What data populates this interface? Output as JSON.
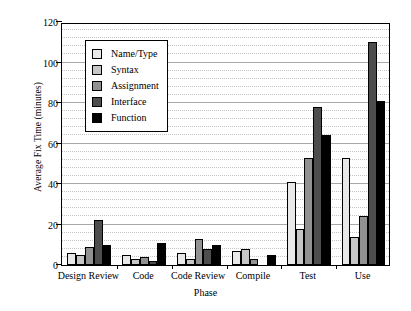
{
  "chart_data": {
    "type": "bar",
    "title": "",
    "xlabel": "Phase",
    "ylabel": "Average Fix Time (minutes)",
    "categories": [
      "Design Review",
      "Code",
      "Code Review",
      "Compile",
      "Test",
      "Use"
    ],
    "series": [
      {
        "name": "Name/Type",
        "color": "#e9e9e9",
        "values": [
          6,
          5,
          6,
          7,
          41,
          53
        ]
      },
      {
        "name": "Syntax",
        "color": "#c6c6c6",
        "values": [
          5,
          3,
          3,
          8,
          18,
          14
        ]
      },
      {
        "name": "Assignment",
        "color": "#919191",
        "values": [
          9,
          4,
          13,
          3,
          53,
          24
        ]
      },
      {
        "name": "Interface",
        "color": "#4d4d4d",
        "values": [
          22,
          2,
          8,
          0,
          78,
          110
        ]
      },
      {
        "name": "Function",
        "color": "#000000",
        "values": [
          10,
          11,
          10,
          5,
          64,
          81
        ]
      }
    ],
    "ylim": [
      0,
      120
    ],
    "ytick_labels": [
      "0",
      "20",
      "40",
      "60",
      "80",
      "100",
      "120"
    ],
    "ytick_values": [
      0,
      20,
      40,
      60,
      80,
      100,
      120
    ],
    "major_gridline_step": 20,
    "minor_gridline_step": 4,
    "grid": true,
    "legend_position": "upper-left-inside"
  }
}
